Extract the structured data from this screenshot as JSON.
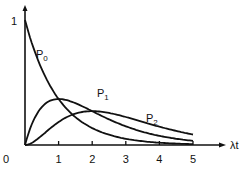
{
  "chart_data": {
    "type": "line",
    "title": "",
    "xlabel": "λt",
    "ylabel": "",
    "x_ticks": [
      "0",
      "1",
      "2",
      "3",
      "4",
      "5"
    ],
    "y_ticks": [
      "1"
    ],
    "xlim": [
      0,
      5.5
    ],
    "ylim": [
      0,
      1.05
    ],
    "grid": false,
    "legend": "inline curve labels",
    "series": [
      {
        "name": "P0",
        "label": "P",
        "sub": "0",
        "formula": "e^(-x)",
        "x": [
          0,
          0.5,
          1,
          1.5,
          2,
          2.5,
          3,
          3.5,
          4,
          4.5,
          5
        ],
        "values": [
          1.0,
          0.61,
          0.37,
          0.22,
          0.14,
          0.08,
          0.05,
          0.03,
          0.02,
          0.01,
          0.01
        ]
      },
      {
        "name": "P1",
        "label": "P",
        "sub": "1",
        "formula": "x·e^(-x)",
        "x": [
          0,
          0.5,
          1,
          1.5,
          2,
          2.5,
          3,
          3.5,
          4,
          4.5,
          5
        ],
        "values": [
          0.0,
          0.3,
          0.37,
          0.33,
          0.27,
          0.21,
          0.15,
          0.11,
          0.07,
          0.05,
          0.03
        ]
      },
      {
        "name": "P2",
        "label": "P",
        "sub": "2",
        "formula": "(x²/2)·e^(-x)",
        "x": [
          0,
          0.5,
          1,
          1.5,
          2,
          2.5,
          3,
          3.5,
          4,
          4.5,
          5
        ],
        "values": [
          0.0,
          0.08,
          0.18,
          0.25,
          0.27,
          0.26,
          0.22,
          0.19,
          0.15,
          0.11,
          0.08
        ]
      }
    ]
  }
}
